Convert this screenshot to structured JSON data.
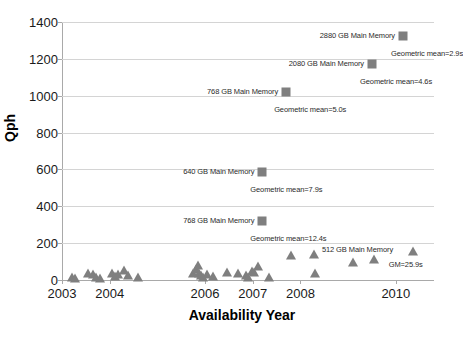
{
  "chart_data": {
    "type": "scatter",
    "title": "",
    "xlabel": "Availability Year",
    "ylabel": "Qph",
    "xlim": [
      2003,
      2010.8
    ],
    "ylim": [
      0,
      1400
    ],
    "grid": true,
    "legend": "none",
    "y_ticks": [
      0,
      200,
      400,
      600,
      800,
      1000,
      1200,
      1400
    ],
    "x_ticks": [
      2003,
      2004,
      2006,
      2007,
      2008,
      2010
    ],
    "series": [
      {
        "name": "Top results (square markers)",
        "marker": "square",
        "color": "#7f7f7f",
        "points": [
          {
            "x": 2010.15,
            "y": 1325,
            "label": "2880 GB Main Memory",
            "sublabel": "Geometric mean=2.9s"
          },
          {
            "x": 2009.5,
            "y": 1172,
            "label": "2080 GB Main Memory",
            "sublabel": "Geometric mean=4.6s"
          },
          {
            "x": 2007.7,
            "y": 1022,
            "label": "768 GB Main Memory",
            "sublabel": "Geometric mean=5.0s"
          },
          {
            "x": 2007.2,
            "y": 585,
            "label": "640 GB Main Memory",
            "sublabel": "Geometric mean=7.9s"
          },
          {
            "x": 2007.2,
            "y": 318,
            "label": "768 GB Main Memory",
            "sublabel": "Geometric mean=12.4s"
          }
        ]
      },
      {
        "name": "All results (triangle markers)",
        "marker": "triangle",
        "color": "#7f7f7f",
        "label": "512 GB Main Memory",
        "sublabel": "GM=25.9s",
        "points": [
          {
            "x": 2003.2,
            "y": 10
          },
          {
            "x": 2003.28,
            "y": 5
          },
          {
            "x": 2003.55,
            "y": 30
          },
          {
            "x": 2003.64,
            "y": 28
          },
          {
            "x": 2003.72,
            "y": 12
          },
          {
            "x": 2003.8,
            "y": 8
          },
          {
            "x": 2004.05,
            "y": 30
          },
          {
            "x": 2004.12,
            "y": 15
          },
          {
            "x": 2004.18,
            "y": 26
          },
          {
            "x": 2004.3,
            "y": 48
          },
          {
            "x": 2004.38,
            "y": 22
          },
          {
            "x": 2004.6,
            "y": 10
          },
          {
            "x": 2005.75,
            "y": 30
          },
          {
            "x": 2005.8,
            "y": 52
          },
          {
            "x": 2005.85,
            "y": 78
          },
          {
            "x": 2005.88,
            "y": 34
          },
          {
            "x": 2005.92,
            "y": 20
          },
          {
            "x": 2005.96,
            "y": 12
          },
          {
            "x": 2006.05,
            "y": 28
          },
          {
            "x": 2006.16,
            "y": 18
          },
          {
            "x": 2006.45,
            "y": 40
          },
          {
            "x": 2006.7,
            "y": 32
          },
          {
            "x": 2006.85,
            "y": 24
          },
          {
            "x": 2006.9,
            "y": 10
          },
          {
            "x": 2006.98,
            "y": 45
          },
          {
            "x": 2007.02,
            "y": 38
          },
          {
            "x": 2007.1,
            "y": 70
          },
          {
            "x": 2007.35,
            "y": 12
          },
          {
            "x": 2007.8,
            "y": 130
          },
          {
            "x": 2008.28,
            "y": 138
          },
          {
            "x": 2008.3,
            "y": 30
          },
          {
            "x": 2009.1,
            "y": 92
          },
          {
            "x": 2009.55,
            "y": 108
          },
          {
            "x": 2010.35,
            "y": 152
          }
        ]
      }
    ]
  }
}
